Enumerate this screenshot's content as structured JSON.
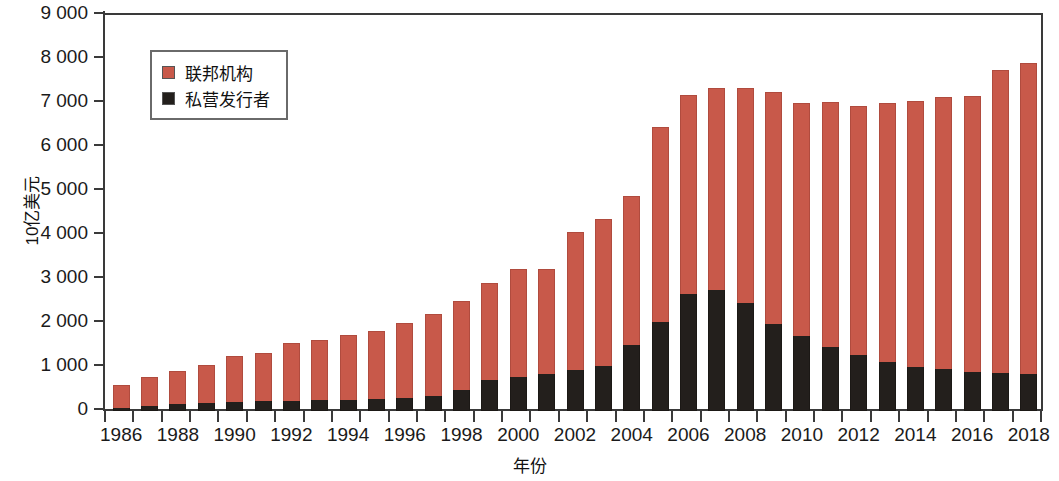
{
  "chart_data": {
    "type": "bar",
    "stacked": true,
    "title": "",
    "xlabel": "年份",
    "ylabel": "10亿美元",
    "ylim": [
      0,
      9000
    ],
    "ytick_values": [
      0,
      1000,
      2000,
      3000,
      4000,
      5000,
      6000,
      7000,
      8000,
      9000
    ],
    "ytick_labels": [
      "0",
      "1 000",
      "2 000",
      "3 000",
      "4 000",
      "5 000",
      "6 000",
      "7 000",
      "8 000",
      "9 000"
    ],
    "grid": false,
    "legend_position": "upper-left-inside",
    "categories": [
      1986,
      1987,
      1988,
      1989,
      1990,
      1991,
      1992,
      1993,
      1994,
      1995,
      1996,
      1997,
      1998,
      1999,
      2000,
      2001,
      2002,
      2003,
      2004,
      2005,
      2006,
      2007,
      2008,
      2009,
      2010,
      2011,
      2012,
      2013,
      2014,
      2015,
      2016,
      2017,
      2018
    ],
    "xtick_labels": [
      "1986",
      "1988",
      "1990",
      "1992",
      "1994",
      "1996",
      "1998",
      "2000",
      "2002",
      "2004",
      "2006",
      "2008",
      "2010",
      "2012",
      "2014",
      "2016",
      "2018"
    ],
    "series": [
      {
        "name": "私营发行者",
        "color": "#231f1c",
        "values": [
          60,
          110,
          150,
          190,
          200,
          220,
          230,
          240,
          260,
          280,
          300,
          350,
          480,
          700,
          770,
          840,
          930,
          1030,
          1500,
          2030,
          2650,
          2750,
          2450,
          1980,
          1700,
          1460,
          1270,
          1120,
          1010,
          960,
          880,
          860,
          840
        ]
      },
      {
        "name": "联邦机构",
        "color": "#c8594a",
        "values": [
          540,
          660,
          770,
          850,
          1040,
          1100,
          1310,
          1370,
          1460,
          1550,
          1700,
          1860,
          2010,
          2220,
          2460,
          2390,
          3140,
          3330,
          3390,
          4420,
          4530,
          4580,
          4880,
          5270,
          5310,
          5560,
          5660,
          5890,
          6030,
          6180,
          6270,
          6890,
          7060
        ]
      }
    ],
    "totals": [
      600,
      770,
      920,
      1040,
      1240,
      1320,
      1540,
      1610,
      1720,
      1830,
      2000,
      2210,
      2490,
      2920,
      3230,
      3230,
      4070,
      4360,
      4890,
      6450,
      7180,
      7330,
      7330,
      7250,
      7010,
      7020,
      6930,
      7010,
      7040,
      7140,
      7150,
      7750,
      7900
    ]
  },
  "legend": {
    "items": [
      {
        "label": "联邦机构",
        "color": "#c8594a",
        "swatch": "red-square-swatch"
      },
      {
        "label": "私营发行者",
        "color": "#231f1c",
        "swatch": "black-square-swatch"
      }
    ]
  },
  "axes": {
    "y_title": "10亿美元",
    "x_title": "年份"
  }
}
